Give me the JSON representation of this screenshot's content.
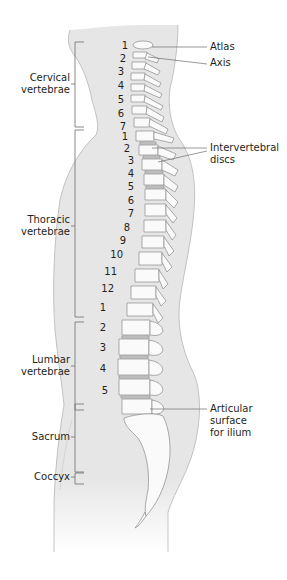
{
  "figure": {
    "colors": {
      "body_fill": "#e6e6e6",
      "body_outline": "#b5b5b5",
      "bone_fill": "#fafafa",
      "bone_outline": "#8a8a8a",
      "leader_line": "#6d6d6d",
      "text": "#231f20"
    }
  },
  "regions": [
    {
      "name": "Cervical vertebrae",
      "line1": "Cervical",
      "line2": "vertebrae",
      "count": 7,
      "numbers": [
        "1",
        "2",
        "3",
        "4",
        "5",
        "6",
        "7"
      ]
    },
    {
      "name": "Thoracic vertebrae",
      "line1": "Thoracic",
      "line2": "vertebrae",
      "count": 12,
      "numbers": [
        "1",
        "2",
        "3",
        "4",
        "5",
        "6",
        "7",
        "8",
        "9",
        "10",
        "11",
        "12"
      ]
    },
    {
      "name": "Lumbar vertebrae",
      "line1": "Lumbar",
      "line2": "vertebrae",
      "count": 5,
      "numbers": [
        "1",
        "2",
        "3",
        "4",
        "5"
      ]
    },
    {
      "name": "Sacrum",
      "line1": "Sacrum"
    },
    {
      "name": "Coccyx",
      "line1": "Coccyx"
    }
  ],
  "callouts": [
    {
      "name": "Atlas",
      "line1": "Atlas"
    },
    {
      "name": "Axis",
      "line1": "Axis"
    },
    {
      "name": "Intervertebral discs",
      "line1": "Intervertebral",
      "line2": "discs"
    },
    {
      "name": "Articular surface for ilium",
      "line1": "Articular",
      "line2": "surface",
      "line3": "for ilium"
    }
  ]
}
